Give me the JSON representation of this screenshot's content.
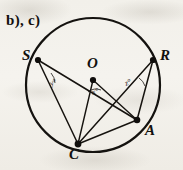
{
  "figure": {
    "part_label": "b), c)",
    "background_color": "#f3f1ec",
    "ink_color": "#12100e",
    "width": 183,
    "height": 170,
    "circle": {
      "center_x": 93,
      "center_y": 85,
      "radius": 67,
      "stroke_width": 2.1
    },
    "points": [
      {
        "id": "S",
        "label": "S",
        "x": 38,
        "y": 60,
        "on_circle": true
      },
      {
        "id": "R",
        "label": "R",
        "x": 153,
        "y": 60,
        "on_circle": true
      },
      {
        "id": "A",
        "label": "A",
        "x": 137,
        "y": 120,
        "on_circle": true
      },
      {
        "id": "C",
        "label": "C",
        "x": 78,
        "y": 144,
        "on_circle": true
      },
      {
        "id": "O",
        "label": "O",
        "x": 93,
        "y": 80,
        "on_circle": false
      }
    ],
    "segments": [
      {
        "from": "S",
        "to": "A",
        "name": "chord-SA"
      },
      {
        "from": "S",
        "to": "C",
        "name": "chord-SC"
      },
      {
        "from": "R",
        "to": "C",
        "name": "chord-RC"
      },
      {
        "from": "R",
        "to": "A",
        "name": "chord-RA"
      },
      {
        "from": "C",
        "to": "A",
        "name": "chord-CA"
      },
      {
        "from": "O",
        "to": "C",
        "name": "radius-OC"
      },
      {
        "from": "O",
        "to": "A",
        "name": "radius-OA"
      }
    ],
    "angles": [
      {
        "id": "y",
        "label": "y°",
        "at_point": "S",
        "name": "inscribed-angle-y"
      },
      {
        "id": "x",
        "label": "x°",
        "at_point": "O",
        "name": "central-angle-x"
      },
      {
        "id": "z",
        "label": "z°",
        "at_point": "R",
        "name": "inscribed-angle-z"
      }
    ]
  }
}
